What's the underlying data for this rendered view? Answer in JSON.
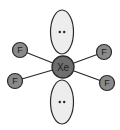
{
  "diagram": {
    "central_atom": {
      "label": "Xe",
      "cx": 63,
      "cy": 67,
      "r": 11,
      "fill": "#6e6e6e"
    },
    "ligands": [
      {
        "label": "F",
        "cx": 20,
        "cy": 50,
        "r": 7.5
      },
      {
        "label": "F",
        "cx": 15,
        "cy": 81,
        "r": 7.5
      },
      {
        "label": "F",
        "cx": 104,
        "cy": 52,
        "r": 7.5
      },
      {
        "label": "F",
        "cx": 107,
        "cy": 83,
        "r": 7.5
      }
    ],
    "ligand_fill": "#8a8a8a",
    "lone_pairs": [
      {
        "label": "••",
        "cx": 62,
        "cy": 32,
        "rx": 11.5,
        "ry": 22
      },
      {
        "label": "••",
        "cx": 62,
        "cy": 102,
        "rx": 11.5,
        "ry": 22
      }
    ],
    "lone_pair_fill": "#ededed",
    "outline_color": "#2a2a2a"
  }
}
